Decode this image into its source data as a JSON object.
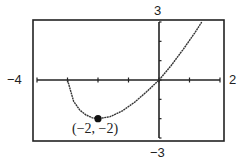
{
  "chart_data": {
    "type": "line",
    "title": "",
    "xlabel": "",
    "ylabel": "",
    "xlim": [
      -4,
      2
    ],
    "ylim": [
      -3,
      3
    ],
    "xtick_step": 1,
    "ytick_step": 1,
    "grid": false,
    "legend": null,
    "series": [
      {
        "name": "f(x)",
        "x": [
          -3,
          -2.8,
          -2.6,
          -2.4,
          -2.2,
          -2,
          -1.6,
          -1.2,
          -0.8,
          -0.4,
          0,
          0.4,
          0.8,
          1.2,
          1.4
        ],
        "y": [
          0,
          -1.1,
          -1.55,
          -1.8,
          -1.95,
          -2,
          -1.9,
          -1.6,
          -1.15,
          -0.6,
          0,
          0.75,
          1.6,
          2.5,
          3
        ]
      }
    ],
    "annotations": [
      {
        "x": -2,
        "y": -2,
        "text": "(−2, −2)",
        "marker": "filled-circle"
      }
    ]
  },
  "labels": {
    "xmin": "−4",
    "xmax": "2",
    "ymax": "3",
    "ymin": "−3",
    "point": "(−2, −2)"
  }
}
